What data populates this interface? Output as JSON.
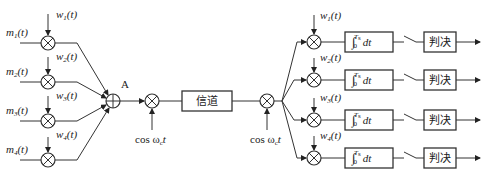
{
  "diagram": {
    "title": "",
    "inputs": [
      {
        "label": "m",
        "sub": "1",
        "arg": "(t)"
      },
      {
        "label": "m",
        "sub": "2",
        "arg": "(t)"
      },
      {
        "label": "m",
        "sub": "3",
        "arg": "(t)"
      },
      {
        "label": "m",
        "sub": "4",
        "arg": "(t)"
      }
    ],
    "tx_codes": [
      {
        "label": "w",
        "sub": "1",
        "arg": "(t)"
      },
      {
        "label": "w",
        "sub": "2",
        "arg": "(t)"
      },
      {
        "label": "w",
        "sub": "3",
        "arg": "(t)"
      },
      {
        "label": "w",
        "sub": "4",
        "arg": "(t)"
      }
    ],
    "summer_node_label": "A",
    "modulator_carrier": {
      "text": "cos ω",
      "sub": "c",
      "tail": "t"
    },
    "channel_label": "信道",
    "demodulator_carrier": {
      "text": "cos ω",
      "sub": "c",
      "tail": "t"
    },
    "rx_codes": [
      {
        "label": "w",
        "sub": "1",
        "arg": "(t)"
      },
      {
        "label": "w",
        "sub": "2",
        "arg": "(t)"
      },
      {
        "label": "w",
        "sub": "3",
        "arg": "(t)"
      },
      {
        "label": "w",
        "sub": "4",
        "arg": "(t)"
      }
    ],
    "integrator": {
      "symbol": "∫",
      "lower": "0",
      "upper": "T",
      "upper_sub": "s",
      "tail": "dt"
    },
    "decision_label": "判决"
  }
}
